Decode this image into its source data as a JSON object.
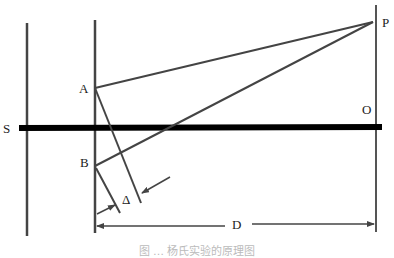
{
  "diagram": {
    "labels": {
      "S": "S",
      "A": "A",
      "B": "B",
      "P": "P",
      "O": "O",
      "delta": "Δ",
      "D": "D"
    },
    "caption": "图 … 杨氏实验的原理图",
    "colors": {
      "line": "#444444",
      "axis": "#000000",
      "background": "#ffffff"
    }
  }
}
